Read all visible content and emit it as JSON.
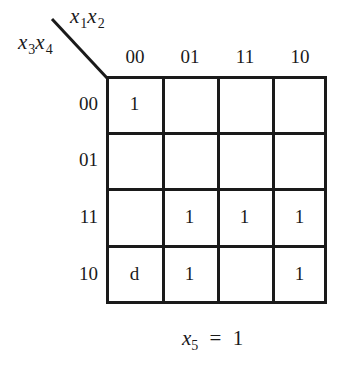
{
  "kmap": {
    "col_vars": {
      "v1": "x",
      "s1": "1",
      "v2": "x",
      "s2": "2"
    },
    "row_vars": {
      "v1": "x",
      "s1": "3",
      "v2": "x",
      "s2": "4"
    },
    "col_headers": [
      "00",
      "01",
      "11",
      "10"
    ],
    "row_headers": [
      "00",
      "01",
      "11",
      "10"
    ],
    "cells": [
      [
        "1",
        "",
        "",
        ""
      ],
      [
        "",
        "",
        "",
        ""
      ],
      [
        "",
        "1",
        "1",
        "1"
      ],
      [
        "d",
        "1",
        "",
        "1"
      ]
    ],
    "footer": {
      "var": "x",
      "sub": "5",
      "eq": "=",
      "value": "1"
    }
  }
}
